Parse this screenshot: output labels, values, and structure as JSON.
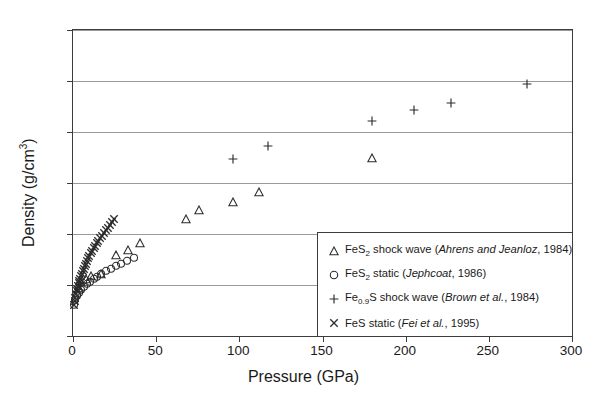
{
  "chart_data": {
    "type": "scatter",
    "title": "",
    "xlabel": "Pressure (GPa)",
    "ylabel": "Density (g/cm3)",
    "ylabel_base": "Density (g/cm",
    "ylabel_sup": "3",
    "ylabel_close": ")",
    "xlim": [
      0,
      300
    ],
    "ylim": [
      4,
      10
    ],
    "xticks": [
      0,
      50,
      100,
      150,
      200,
      250,
      300
    ],
    "yticks": [
      4,
      5,
      6,
      7,
      8,
      9,
      10
    ],
    "grid": "horizontal",
    "legend_position": "bottom-right",
    "series": [
      {
        "name": "FeS2 shock wave (Ahrens and Jeanloz, 1984)",
        "marker": "triangle",
        "color": "#2b2b2b",
        "points": [
          [
            3.5,
            4.95
          ],
          [
            5.0,
            5.05
          ],
          [
            8.0,
            5.12
          ],
          [
            11.0,
            5.18
          ],
          [
            17.0,
            5.22
          ],
          [
            26.0,
            5.58
          ],
          [
            33.0,
            5.68
          ],
          [
            40.0,
            5.82
          ],
          [
            68.0,
            6.3
          ],
          [
            76.0,
            6.47
          ],
          [
            96.0,
            6.62
          ],
          [
            112.0,
            6.83
          ],
          [
            180.0,
            7.5
          ]
        ]
      },
      {
        "name": "FeS2 static (Jephcoat, 1986)",
        "marker": "circle",
        "color": "#2b2b2b",
        "points": [
          [
            0.5,
            4.62
          ],
          [
            1.5,
            4.72
          ],
          [
            2.5,
            4.8
          ],
          [
            3.5,
            4.86
          ],
          [
            5.0,
            4.92
          ],
          [
            6.5,
            4.97
          ],
          [
            8.5,
            5.02
          ],
          [
            10.5,
            5.07
          ],
          [
            12.5,
            5.12
          ],
          [
            14.5,
            5.16
          ],
          [
            17.0,
            5.22
          ],
          [
            20.0,
            5.28
          ],
          [
            23.0,
            5.33
          ],
          [
            26.0,
            5.38
          ],
          [
            29.0,
            5.43
          ],
          [
            32.5,
            5.48
          ],
          [
            36.5,
            5.53
          ]
        ]
      },
      {
        "name": "Fe0.9S shock wave (Brown et al., 1984)",
        "marker": "plus",
        "color": "#2b2b2b",
        "points": [
          [
            96.0,
            7.48
          ],
          [
            117.0,
            7.72
          ],
          [
            180.0,
            8.22
          ],
          [
            205.0,
            8.43
          ],
          [
            227.0,
            8.57
          ],
          [
            273.0,
            8.95
          ]
        ]
      },
      {
        "name": "FeS static (Fei et al., 1995)",
        "marker": "x",
        "color": "#2b2b2b",
        "points": [
          [
            0.6,
            4.6
          ],
          [
            1.0,
            4.68
          ],
          [
            1.4,
            4.75
          ],
          [
            1.8,
            4.82
          ],
          [
            2.2,
            4.88
          ],
          [
            2.6,
            4.93
          ],
          [
            3.0,
            4.98
          ],
          [
            3.4,
            5.03
          ],
          [
            3.8,
            5.08
          ],
          [
            4.2,
            5.12
          ],
          [
            4.7,
            5.17
          ],
          [
            5.2,
            5.22
          ],
          [
            5.8,
            5.27
          ],
          [
            6.4,
            5.32
          ],
          [
            7.0,
            5.37
          ],
          [
            7.7,
            5.42
          ],
          [
            8.4,
            5.47
          ],
          [
            9.1,
            5.52
          ],
          [
            9.9,
            5.57
          ],
          [
            10.7,
            5.62
          ],
          [
            11.5,
            5.67
          ],
          [
            12.4,
            5.72
          ],
          [
            13.3,
            5.77
          ],
          [
            14.3,
            5.82
          ],
          [
            15.3,
            5.87
          ],
          [
            16.3,
            5.92
          ],
          [
            17.4,
            5.97
          ],
          [
            18.5,
            6.02
          ],
          [
            19.7,
            6.07
          ],
          [
            20.9,
            6.12
          ],
          [
            22.2,
            6.18
          ],
          [
            23.5,
            6.24
          ],
          [
            24.5,
            6.3
          ]
        ]
      }
    ]
  },
  "legend": {
    "entries": [
      {
        "symbol": "triangle",
        "formula": "FeS",
        "sub": "2",
        "method": " shock wave (",
        "ref": "Ahrens and Jeanloz",
        "year": ", 1984)"
      },
      {
        "symbol": "circle",
        "formula": "FeS",
        "sub": "2",
        "method": " static (",
        "ref": "Jephcoat",
        "year": ", 1986)"
      },
      {
        "symbol": "plus",
        "formula": "Fe",
        "sub": "0.9",
        "method": "S shock wave (",
        "ref": "Brown et al.",
        "year": ", 1984)"
      },
      {
        "symbol": "x",
        "formula": "FeS",
        "sub": "",
        "method": " static (",
        "ref": "Fei et al.",
        "year": ", 1995)"
      }
    ]
  }
}
